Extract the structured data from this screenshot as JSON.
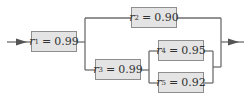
{
  "diagram": {
    "type": "reliability-block-diagram",
    "line_color": "#6e6e6e",
    "box_fill": "#e4e4e4",
    "box_border": "#8e8e8e",
    "components": [
      {
        "id": "r1",
        "symbol": "r",
        "subscript": "1",
        "equals": "=",
        "value": "0.99"
      },
      {
        "id": "r2",
        "symbol": "r",
        "subscript": "2",
        "equals": "=",
        "value": "0.90"
      },
      {
        "id": "r3",
        "symbol": "r",
        "subscript": "3",
        "equals": "=",
        "value": "0.99"
      },
      {
        "id": "r4",
        "symbol": "r",
        "subscript": "4",
        "equals": "=",
        "value": "0.95"
      },
      {
        "id": "r5",
        "symbol": "r",
        "subscript": "5",
        "equals": "=",
        "value": "0.92"
      }
    ],
    "connections": [
      "input -> r1",
      "r1 -> (r2 || (r3 -> (r4 || r5)))",
      "-> output"
    ]
  }
}
